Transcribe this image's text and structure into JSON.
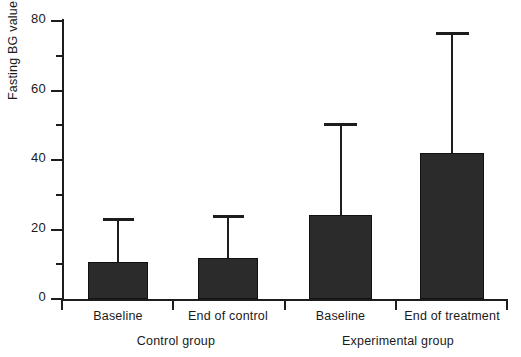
{
  "chart_data": {
    "type": "bar",
    "title": "",
    "xlabel": "",
    "ylabel": "Fasting BG value (%)",
    "ylim": [
      0,
      80
    ],
    "ytick_major": [
      0,
      20,
      40,
      60,
      80
    ],
    "ytick_minor": [
      10,
      30,
      50,
      70
    ],
    "ytick_labels": [
      "0",
      "20",
      "40",
      "60",
      "80"
    ],
    "grid": false,
    "legend": "none",
    "error_bars": "upper-only",
    "categories": [
      "Baseline",
      "End of control",
      "Baseline",
      "End of treatment"
    ],
    "groups": [
      {
        "name": "Control group",
        "categories": [
          "Baseline",
          "End of control"
        ]
      },
      {
        "name": "Experimental group",
        "categories": [
          "Baseline",
          "End of treatment"
        ]
      }
    ],
    "values": [
      10.6,
      11.8,
      24.2,
      42.0
    ],
    "error_upper": [
      23.3,
      24.2,
      50.6,
      76.8
    ],
    "bars": [
      {
        "label": "Baseline",
        "group": "Control group",
        "value": 10.6,
        "error_top": 23.3
      },
      {
        "label": "End of control",
        "group": "Control group",
        "value": 11.8,
        "error_top": 24.2
      },
      {
        "label": "Baseline",
        "group": "Experimental group",
        "value": 24.2,
        "error_top": 50.6
      },
      {
        "label": "End of treatment",
        "group": "Experimental group",
        "value": 42.0,
        "error_top": 76.8
      }
    ],
    "colors": {
      "bar_fill": "#2b2b2b",
      "bar_edge": "#111111",
      "axis": "#1d1d1d",
      "text": "#1a1a1a",
      "background": "#ffffff"
    }
  }
}
